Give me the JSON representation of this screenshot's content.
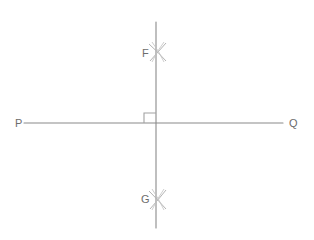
{
  "figure": {
    "width": 314,
    "height": 240,
    "background_color": "#ffffff",
    "stroke_color": "#8a8a8a",
    "arc_color": "#b0b0b0",
    "label_color": "#6d6d6d",
    "stroke_width": 1
  },
  "labels": {
    "left_endpoint": "P",
    "right_endpoint": "Q",
    "upper_arc_point": "F",
    "lower_arc_point": "G"
  },
  "geometry": {
    "horizontal_line": {
      "name": "line-PQ",
      "x1": 24,
      "y1": 123,
      "x2": 283,
      "y2": 123
    },
    "vertical_line": {
      "name": "perpendicular-line-FG",
      "x1": 156,
      "y1": 22,
      "x2": 156,
      "y2": 228
    },
    "right_angle_marker": {
      "name": "right-angle-square",
      "x": 144,
      "y": 113,
      "width": 12,
      "height": 10,
      "quadrant": "upper-left"
    },
    "arc_cross_upper": {
      "name": "arc-intersection-F",
      "cx": 158,
      "cy": 52
    },
    "arc_cross_lower": {
      "name": "arc-intersection-G",
      "cx": 158,
      "cy": 200
    }
  },
  "label_positions": {
    "P": {
      "x": 15,
      "y": 118
    },
    "Q": {
      "x": 289,
      "y": 118
    },
    "F": {
      "x": 142,
      "y": 48
    },
    "G": {
      "x": 141,
      "y": 194
    }
  }
}
